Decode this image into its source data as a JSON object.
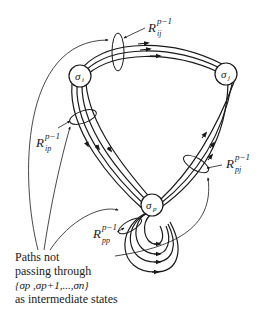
{
  "diagram": {
    "nodes": {
      "i": {
        "symbol": "σ",
        "sub": "i"
      },
      "j": {
        "symbol": "σ",
        "sub": "j"
      },
      "p": {
        "symbol": "σ",
        "sub": "p"
      }
    },
    "labels": {
      "Rij": {
        "main": "R",
        "sup": "p−1",
        "sub": "ij"
      },
      "Rip": {
        "main": "R",
        "sup": "p−1",
        "sub": "ip"
      },
      "Rpj": {
        "main": "R",
        "sup": "p−1",
        "sub": "pj"
      },
      "Rpp": {
        "main": "R",
        "sup": "p−1",
        "sub": "pp"
      }
    },
    "caption": {
      "line1": "Paths not",
      "line2": "passing through",
      "line3": "{σp ,σp+1,...,σn}",
      "line4": "as intermediate states"
    },
    "colors": {
      "stroke": "#1a1a1a",
      "background": "#ffffff"
    }
  }
}
